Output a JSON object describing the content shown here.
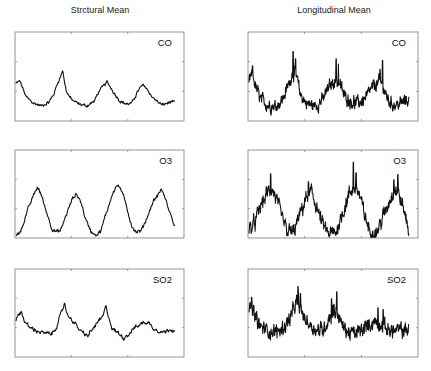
{
  "chart_data": [
    {
      "type": "line",
      "column_title": "Strctural Mean",
      "label": "CO",
      "xlim": [
        0,
        120
      ],
      "ylim": [
        0,
        1
      ],
      "grid": false,
      "x_ticks_fraction": [
        0.333,
        0.667
      ],
      "y_ticks_fraction": [
        0.333,
        0.667
      ],
      "noise": 0.015,
      "keypoints": [
        [
          0,
          0.42
        ],
        [
          3,
          0.45
        ],
        [
          5,
          0.38
        ],
        [
          8,
          0.27
        ],
        [
          14,
          0.2
        ],
        [
          20,
          0.17
        ],
        [
          26,
          0.21
        ],
        [
          30,
          0.3
        ],
        [
          33,
          0.43
        ],
        [
          36,
          0.52
        ],
        [
          37,
          0.58
        ],
        [
          38,
          0.48
        ],
        [
          40,
          0.33
        ],
        [
          44,
          0.24
        ],
        [
          50,
          0.19
        ],
        [
          56,
          0.17
        ],
        [
          62,
          0.22
        ],
        [
          66,
          0.34
        ],
        [
          70,
          0.4
        ],
        [
          72,
          0.44
        ],
        [
          75,
          0.38
        ],
        [
          79,
          0.29
        ],
        [
          83,
          0.22
        ],
        [
          88,
          0.19
        ],
        [
          92,
          0.2
        ],
        [
          96,
          0.32
        ],
        [
          100,
          0.4
        ],
        [
          103,
          0.38
        ],
        [
          107,
          0.29
        ],
        [
          111,
          0.23
        ],
        [
          116,
          0.18
        ],
        [
          120,
          0.2
        ],
        [
          124,
          0.22
        ],
        [
          126,
          0.2
        ]
      ]
    },
    {
      "type": "line",
      "column_title": "Longitudinal Mean",
      "label": "CO",
      "xlim": [
        0,
        120
      ],
      "ylim": [
        0,
        1
      ],
      "grid": false,
      "x_ticks_fraction": [
        0.333,
        0.667
      ],
      "y_ticks_fraction": [
        0.333,
        0.667
      ],
      "noise": 0.06,
      "spikes": [
        [
          3,
          0.62
        ],
        [
          37,
          0.78
        ],
        [
          39,
          0.7
        ],
        [
          73,
          0.7
        ],
        [
          75,
          0.64
        ],
        [
          112,
          0.68
        ],
        [
          110,
          0.58
        ]
      ],
      "keypoints": [
        [
          0,
          0.46
        ],
        [
          3,
          0.52
        ],
        [
          6,
          0.36
        ],
        [
          10,
          0.24
        ],
        [
          16,
          0.18
        ],
        [
          22,
          0.17
        ],
        [
          28,
          0.24
        ],
        [
          33,
          0.4
        ],
        [
          37,
          0.56
        ],
        [
          40,
          0.48
        ],
        [
          43,
          0.3
        ],
        [
          48,
          0.2
        ],
        [
          55,
          0.17
        ],
        [
          62,
          0.24
        ],
        [
          67,
          0.38
        ],
        [
          72,
          0.46
        ],
        [
          76,
          0.42
        ],
        [
          80,
          0.28
        ],
        [
          86,
          0.22
        ],
        [
          92,
          0.2
        ],
        [
          98,
          0.26
        ],
        [
          104,
          0.38
        ],
        [
          109,
          0.44
        ],
        [
          112,
          0.4
        ],
        [
          115,
          0.28
        ],
        [
          119,
          0.2
        ],
        [
          124,
          0.18
        ],
        [
          130,
          0.22
        ],
        [
          134,
          0.24
        ]
      ]
    },
    {
      "type": "line",
      "label": "O3",
      "xlim": [
        0,
        120
      ],
      "ylim": [
        0,
        1
      ],
      "grid": false,
      "x_ticks_fraction": [
        0.333,
        0.667
      ],
      "y_ticks_fraction": [
        0.333,
        0.667
      ],
      "noise": 0.018,
      "keypoints": [
        [
          0,
          0.02
        ],
        [
          4,
          0.1
        ],
        [
          9,
          0.33
        ],
        [
          14,
          0.52
        ],
        [
          16,
          0.58
        ],
        [
          19,
          0.48
        ],
        [
          23,
          0.28
        ],
        [
          27,
          0.1
        ],
        [
          30,
          0.07
        ],
        [
          33,
          0.08
        ],
        [
          37,
          0.25
        ],
        [
          42,
          0.45
        ],
        [
          45,
          0.5
        ],
        [
          48,
          0.42
        ],
        [
          52,
          0.2
        ],
        [
          56,
          0.07
        ],
        [
          60,
          0.04
        ],
        [
          63,
          0.08
        ],
        [
          67,
          0.28
        ],
        [
          72,
          0.52
        ],
        [
          75,
          0.6
        ],
        [
          78,
          0.56
        ],
        [
          82,
          0.36
        ],
        [
          86,
          0.14
        ],
        [
          89,
          0.07
        ],
        [
          93,
          0.08
        ],
        [
          97,
          0.22
        ],
        [
          102,
          0.42
        ],
        [
          106,
          0.5
        ],
        [
          108,
          0.56
        ],
        [
          111,
          0.44
        ],
        [
          115,
          0.26
        ],
        [
          118,
          0.13
        ]
      ]
    },
    {
      "type": "line",
      "label": "O3",
      "xlim": [
        0,
        120
      ],
      "ylim": [
        0,
        1
      ],
      "grid": false,
      "x_ticks_fraction": [
        0.333,
        0.667
      ],
      "y_ticks_fraction": [
        0.333,
        0.667
      ],
      "noise": 0.07,
      "spikes": [
        [
          16,
          0.73
        ],
        [
          44,
          0.64
        ],
        [
          77,
          0.86
        ],
        [
          79,
          0.74
        ],
        [
          110,
          0.72
        ],
        [
          107,
          0.66
        ]
      ],
      "keypoints": [
        [
          0,
          0.1
        ],
        [
          4,
          0.16
        ],
        [
          9,
          0.38
        ],
        [
          14,
          0.52
        ],
        [
          17,
          0.56
        ],
        [
          20,
          0.45
        ],
        [
          24,
          0.24
        ],
        [
          28,
          0.08
        ],
        [
          33,
          0.06
        ],
        [
          38,
          0.28
        ],
        [
          43,
          0.48
        ],
        [
          46,
          0.52
        ],
        [
          49,
          0.4
        ],
        [
          54,
          0.16
        ],
        [
          59,
          0.04
        ],
        [
          64,
          0.06
        ],
        [
          69,
          0.28
        ],
        [
          74,
          0.5
        ],
        [
          78,
          0.58
        ],
        [
          81,
          0.52
        ],
        [
          85,
          0.28
        ],
        [
          89,
          0.08
        ],
        [
          94,
          0.06
        ],
        [
          99,
          0.24
        ],
        [
          104,
          0.44
        ],
        [
          108,
          0.56
        ],
        [
          111,
          0.48
        ],
        [
          115,
          0.28
        ],
        [
          118,
          0.1
        ]
      ]
    },
    {
      "type": "line",
      "label": "SO2",
      "xlim": [
        0,
        120
      ],
      "ylim": [
        0,
        1
      ],
      "grid": false,
      "x_ticks_fraction": [
        0.333,
        0.667
      ],
      "y_ticks_fraction": [
        0.333,
        0.667
      ],
      "noise": 0.02,
      "keypoints": [
        [
          0,
          0.42
        ],
        [
          4,
          0.52
        ],
        [
          7,
          0.4
        ],
        [
          10,
          0.34
        ],
        [
          16,
          0.3
        ],
        [
          22,
          0.27
        ],
        [
          28,
          0.26
        ],
        [
          32,
          0.36
        ],
        [
          36,
          0.52
        ],
        [
          38,
          0.62
        ],
        [
          40,
          0.48
        ],
        [
          44,
          0.42
        ],
        [
          48,
          0.34
        ],
        [
          52,
          0.27
        ],
        [
          56,
          0.24
        ],
        [
          60,
          0.32
        ],
        [
          64,
          0.4
        ],
        [
          68,
          0.46
        ],
        [
          70,
          0.57
        ],
        [
          72,
          0.48
        ],
        [
          75,
          0.32
        ],
        [
          80,
          0.27
        ],
        [
          84,
          0.22
        ],
        [
          88,
          0.26
        ],
        [
          92,
          0.33
        ],
        [
          96,
          0.36
        ],
        [
          100,
          0.4
        ],
        [
          104,
          0.38
        ],
        [
          108,
          0.32
        ],
        [
          112,
          0.3
        ],
        [
          116,
          0.28
        ],
        [
          120,
          0.32
        ],
        [
          124,
          0.31
        ]
      ]
    },
    {
      "type": "line",
      "label": "SO2",
      "xlim": [
        0,
        120
      ],
      "ylim": [
        0,
        1
      ],
      "grid": false,
      "x_ticks_fraction": [
        0.333,
        0.667
      ],
      "y_ticks_fraction": [
        0.333,
        0.667
      ],
      "noise": 0.07,
      "spikes": [
        [
          2,
          0.68
        ],
        [
          38,
          0.8
        ],
        [
          40,
          0.72
        ],
        [
          64,
          0.66
        ],
        [
          68,
          0.74
        ],
        [
          66,
          0.6
        ],
        [
          100,
          0.56
        ],
        [
          104,
          0.54
        ]
      ],
      "keypoints": [
        [
          0,
          0.5
        ],
        [
          2,
          0.58
        ],
        [
          5,
          0.44
        ],
        [
          9,
          0.34
        ],
        [
          15,
          0.3
        ],
        [
          20,
          0.28
        ],
        [
          26,
          0.32
        ],
        [
          32,
          0.44
        ],
        [
          37,
          0.62
        ],
        [
          40,
          0.54
        ],
        [
          43,
          0.44
        ],
        [
          48,
          0.36
        ],
        [
          53,
          0.3
        ],
        [
          58,
          0.32
        ],
        [
          62,
          0.44
        ],
        [
          66,
          0.52
        ],
        [
          69,
          0.5
        ],
        [
          72,
          0.36
        ],
        [
          77,
          0.28
        ],
        [
          82,
          0.26
        ],
        [
          87,
          0.3
        ],
        [
          92,
          0.36
        ],
        [
          97,
          0.4
        ],
        [
          102,
          0.38
        ],
        [
          107,
          0.32
        ],
        [
          112,
          0.3
        ],
        [
          118,
          0.3
        ],
        [
          124,
          0.32
        ]
      ]
    }
  ]
}
